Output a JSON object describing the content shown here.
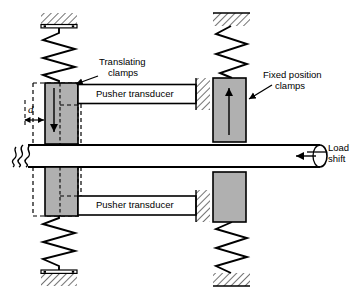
{
  "figure": {
    "type": "mechanical-diagram"
  },
  "labels": {
    "translating_clamps": "Translating\nclamps",
    "translating_clamps_line1": "Translating",
    "translating_clamps_line2": "clamps",
    "fixed_position_clamps_line1": "Fixed position",
    "fixed_position_clamps_line2": "clamps",
    "pusher_transducer_top": "Pusher transducer",
    "pusher_transducer_bottom": "Pusher transducer",
    "load_shift_line1": "Load",
    "load_shift_line2": "shift",
    "displacement": "d"
  },
  "colors": {
    "clamp_fill": "#b0b0b0",
    "stroke": "#000000",
    "background": "#ffffff",
    "hatch": "#000000",
    "rod_fill": "#ffffff"
  },
  "components": {
    "springs": [
      {
        "name": "top-left-spring",
        "anchor": "ground-bar"
      },
      {
        "name": "top-right-spring",
        "anchor": "ground-plain"
      },
      {
        "name": "bottom-left-spring",
        "anchor": "ground-bar"
      },
      {
        "name": "bottom-right-spring",
        "anchor": "ground-plain"
      }
    ],
    "translating_clamps": [
      {
        "name": "upper-translating-clamp",
        "arrow": "down"
      },
      {
        "name": "lower-translating-clamp",
        "arrow": "up"
      }
    ],
    "fixed_clamps": [
      {
        "name": "upper-fixed-clamp",
        "arrow": "up"
      },
      {
        "name": "lower-fixed-clamp",
        "arrow": "none"
      }
    ],
    "load_rod": {
      "name": "load-rod",
      "break_symbol_left": true,
      "arrow": "left"
    }
  }
}
